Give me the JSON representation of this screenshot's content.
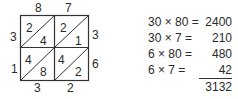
{
  "lattice": {
    "top_digits": [
      "8",
      "7"
    ],
    "left_digits": [
      "3",
      "1"
    ],
    "right_digits": [
      "3",
      "6"
    ],
    "bottom_digits": [
      "3",
      "2"
    ],
    "cells": [
      {
        "upper": "2",
        "lower": "4"
      },
      {
        "upper": "2",
        "lower": "1"
      },
      {
        "upper": "4",
        "lower": "8"
      },
      {
        "upper": "4",
        "lower": "2"
      }
    ]
  },
  "partial_products": [
    {
      "expr": "30 × 80 =",
      "value": "2400"
    },
    {
      "expr": "30 × 7 =",
      "value": "210"
    },
    {
      "expr": "6 × 80 =",
      "value": "480"
    },
    {
      "expr": "6 × 7 =",
      "value": "42"
    }
  ],
  "total": "3132"
}
